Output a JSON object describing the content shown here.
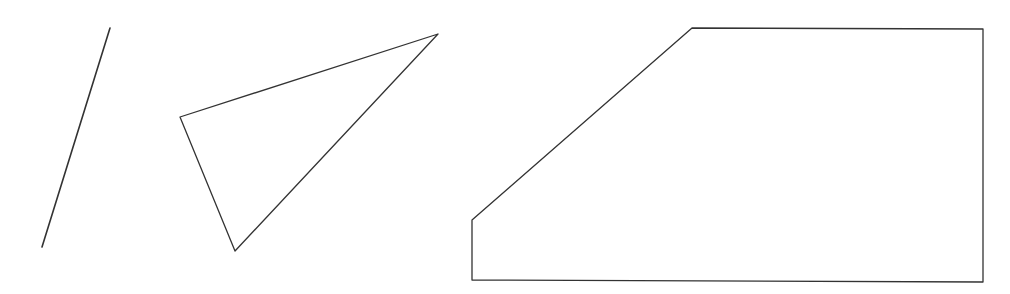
{
  "canvas": {
    "width": 1010,
    "height": 294,
    "background": "#ffffff"
  },
  "stroke_color": "#333333",
  "shapes": [
    {
      "type": "line",
      "name": "line-segment",
      "points": [
        [
          110,
          28
        ],
        [
          42,
          247
        ]
      ],
      "stroke_width": 1.6
    },
    {
      "type": "triangle",
      "name": "triangle",
      "points": [
        [
          180,
          117
        ],
        [
          438,
          34
        ],
        [
          235,
          251
        ]
      ],
      "stroke_width": 1.3
    },
    {
      "type": "pentagon",
      "name": "pentagon",
      "points": [
        [
          472,
          220
        ],
        [
          692,
          28
        ],
        [
          983,
          29
        ],
        [
          983,
          282
        ],
        [
          472,
          280
        ]
      ],
      "stroke_width": 1.3
    }
  ]
}
